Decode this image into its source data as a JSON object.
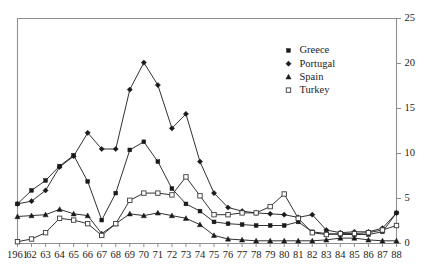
{
  "chart_data": {
    "type": "line",
    "title": "",
    "subtitle": "",
    "xlabel": "",
    "ylabel": "",
    "xlim": [
      1961,
      1988
    ],
    "ylim": [
      0,
      25
    ],
    "y_ticks": [
      0,
      5,
      10,
      15,
      20,
      25
    ],
    "y_axis_position": "right",
    "grid": false,
    "legend_position": "top-right",
    "x": [
      1961,
      1962,
      1963,
      1964,
      1965,
      1966,
      1967,
      1968,
      1969,
      1970,
      1971,
      1972,
      1973,
      1974,
      1975,
      1976,
      1977,
      1978,
      1979,
      1980,
      1981,
      1982,
      1983,
      1984,
      1985,
      1986,
      1987,
      1988
    ],
    "categories": [
      "1961",
      "62",
      "63",
      "64",
      "65",
      "66",
      "67",
      "68",
      "69",
      "70",
      "71",
      "72",
      "73",
      "74",
      "75",
      "76",
      "77",
      "78",
      "79",
      "80",
      "81",
      "82",
      "83",
      "84",
      "85",
      "86",
      "87",
      "88"
    ],
    "series": [
      {
        "name": "Greece",
        "marker": "filled-square",
        "values": [
          4.4,
          5.9,
          7.0,
          8.6,
          9.8,
          6.9,
          2.6,
          5.6,
          10.4,
          11.3,
          9.1,
          6.1,
          4.4,
          3.6,
          2.4,
          2.2,
          2.1,
          2.0,
          2.0,
          2.0,
          2.4,
          1.3,
          1.1,
          1.0,
          1.0,
          1.0,
          1.3,
          3.4
        ]
      },
      {
        "name": "Portugal",
        "marker": "filled-diamond",
        "values": [
          4.4,
          4.7,
          5.9,
          8.5,
          9.7,
          12.3,
          10.5,
          10.5,
          17.1,
          20.1,
          17.6,
          12.8,
          14.4,
          9.1,
          5.6,
          4.0,
          3.6,
          3.4,
          3.3,
          3.2,
          2.9,
          3.2,
          1.5,
          1.2,
          1.3,
          1.3,
          1.7,
          3.4
        ]
      },
      {
        "name": "Spain",
        "marker": "filled-triangle",
        "values": [
          3.0,
          3.1,
          3.2,
          3.8,
          3.3,
          3.1,
          1.1,
          2.2,
          3.3,
          3.1,
          3.4,
          3.1,
          2.8,
          2.1,
          0.9,
          0.5,
          0.4,
          0.3,
          0.3,
          0.3,
          0.3,
          0.3,
          0.4,
          0.6,
          0.6,
          0.4,
          0.3,
          0.3
        ]
      },
      {
        "name": "Turkey",
        "marker": "open-square",
        "values": [
          0.2,
          0.5,
          1.2,
          2.8,
          2.6,
          2.2,
          0.9,
          2.2,
          4.8,
          5.6,
          5.6,
          5.4,
          7.4,
          5.3,
          3.2,
          3.2,
          3.4,
          3.4,
          4.1,
          5.5,
          2.8,
          1.2,
          1.0,
          1.1,
          1.1,
          1.2,
          1.5,
          2.0
        ]
      }
    ],
    "legend": [
      {
        "label": "Greece",
        "marker": "filled-square"
      },
      {
        "label": "Portugal",
        "marker": "filled-diamond"
      },
      {
        "label": "Spain",
        "marker": "filled-triangle"
      },
      {
        "label": "Turkey",
        "marker": "open-square"
      }
    ],
    "colors": {
      "series": "#1a1a1a",
      "axis": "#8f8f8f",
      "text": "#222222",
      "background": "#ffffff"
    }
  }
}
